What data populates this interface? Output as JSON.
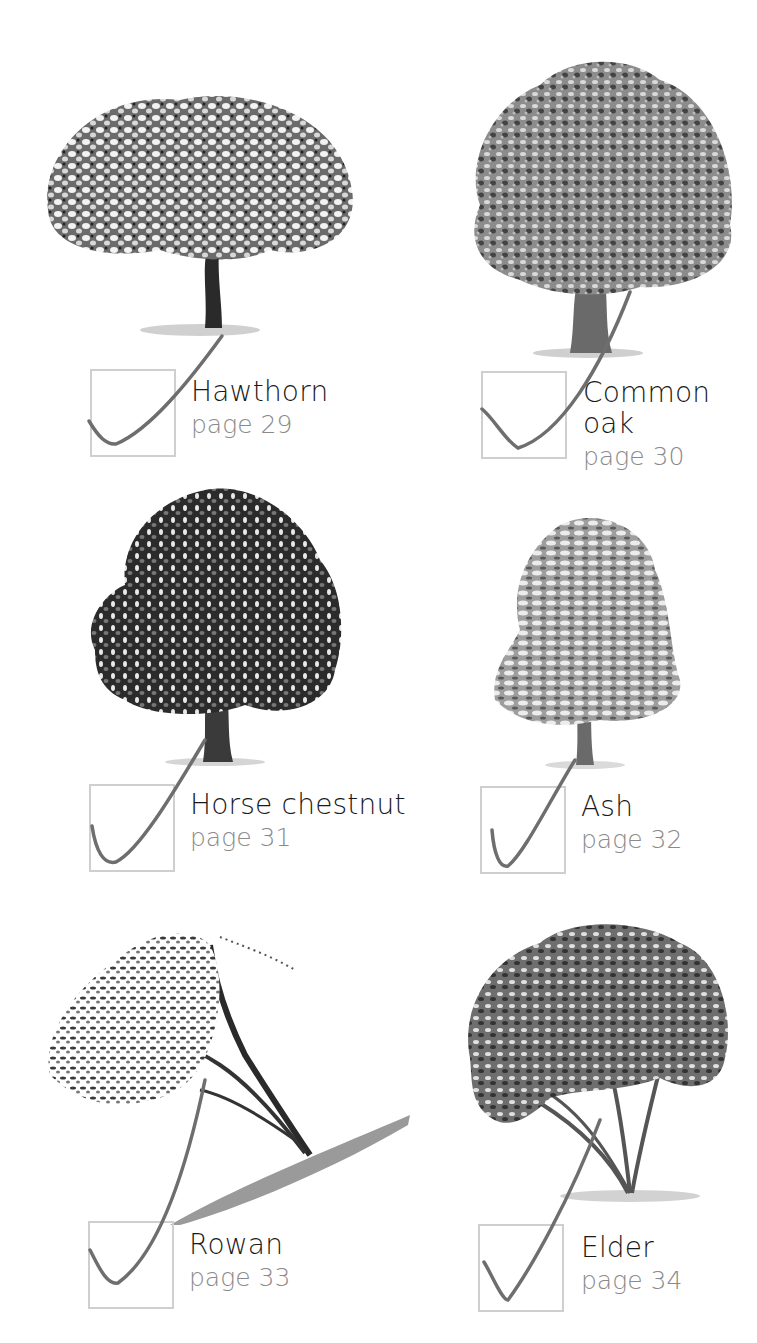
{
  "trees": [
    {
      "name": "Hawthorn",
      "page": "page 29",
      "icon": "hawthorn-tree-illustration"
    },
    {
      "name": "Common oak",
      "name_lines": [
        "Common",
        "oak"
      ],
      "page": "page 30",
      "icon": "oak-tree-illustration"
    },
    {
      "name": "Horse chestnut",
      "page": "page 31",
      "icon": "horse-chestnut-tree-illustration"
    },
    {
      "name": "Ash",
      "page": "page 32",
      "icon": "ash-tree-illustration"
    },
    {
      "name": "Rowan",
      "page": "page 33",
      "icon": "rowan-tree-illustration"
    },
    {
      "name": "Elder",
      "page": "page 34",
      "icon": "elder-tree-illustration"
    }
  ],
  "colors": {
    "name_text": "#1a1a1a",
    "page_text": "#8a8a8a",
    "checkbox_border": "#cfcfcf",
    "check_line": "#6e6e6e"
  }
}
